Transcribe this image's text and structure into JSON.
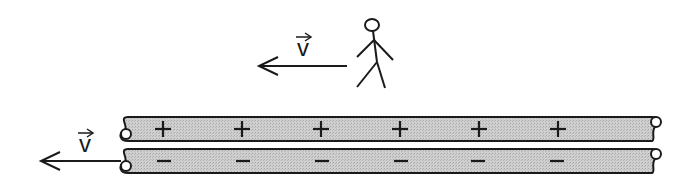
{
  "diagram": {
    "observer": {
      "velocity_label": "v",
      "arrow_direction": "left"
    },
    "wire": {
      "velocity_label": "v",
      "arrow_direction": "left",
      "top_strip_signs": [
        "+",
        "+",
        "+",
        "+",
        "+",
        "+"
      ],
      "bottom_strip_signs": [
        "−",
        "−",
        "−",
        "−",
        "−",
        "−"
      ],
      "fill_color": "#c8c8c8",
      "stroke_color": "#1a1a1a"
    }
  }
}
